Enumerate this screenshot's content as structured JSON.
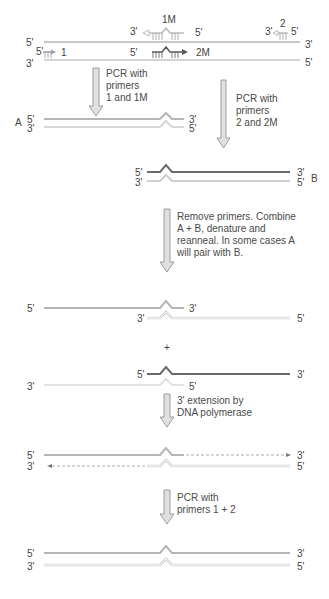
{
  "colors": {
    "strand_light": "#b8b8b8",
    "strand_dark": "#6e6e6e",
    "strand_outline": "#c8c8c8",
    "arrow_fill": "#d9d9d9",
    "arrow_stroke": "#8a8a8a",
    "text": "#444444"
  },
  "template": {
    "top_left": "5'",
    "top_right": "3'",
    "bottom_left": "3'",
    "bottom_right": "5'",
    "primer_1M": {
      "label": "1M",
      "end3": "3'",
      "end5": "5'"
    },
    "primer_2": {
      "label": "2",
      "end3": "3'",
      "end5": "5'"
    },
    "primer_1": {
      "label": "1",
      "end5": "5'"
    },
    "primer_2M": {
      "label": "2M",
      "end5": "5'"
    }
  },
  "steps": {
    "pcr_a": "PCR with\nprimers\n1 and 1M",
    "pcr_b": "PCR with\nprimers\n2 and 2M",
    "combine": "Remove primers. Combine\nA + B, denature and\nreanneal. In some cases A\nwill pair with B.",
    "extension": "3' extension by\nDNA polymerase",
    "final_pcr": "PCR with\nprimers 1 + 2"
  },
  "product_a": {
    "name": "A",
    "top_left": "5'",
    "top_right": "3'",
    "bottom_left": "3'",
    "bottom_right": "5'"
  },
  "product_b": {
    "name": "B",
    "top_left": "5'",
    "top_right": "3'",
    "bottom_left": "3'",
    "bottom_right": "5'"
  },
  "annealed_1": {
    "top_left": "5'",
    "top_right": "3'",
    "bottom_left": "3'",
    "bottom_right": "5'"
  },
  "plus": "+",
  "annealed_2": {
    "top_left": "5'",
    "top_right": "3'",
    "bottom_left": "3'",
    "bottom_right": "5'"
  },
  "extended": {
    "top_left": "5'",
    "top_right": "3'",
    "bottom_left": "3'",
    "bottom_right": "5'"
  },
  "final": {
    "top_left": "5'",
    "top_right": "3'",
    "bottom_left": "3'",
    "bottom_right": "5'"
  }
}
